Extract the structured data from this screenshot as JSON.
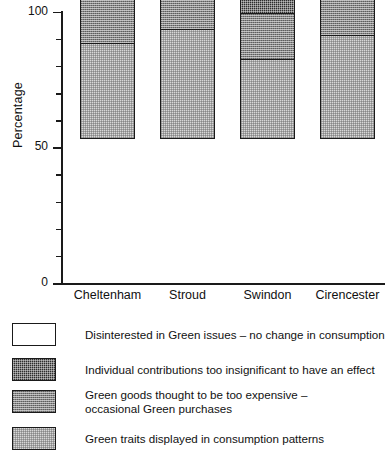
{
  "chart_data": {
    "type": "bar",
    "subtype": "stacked-bar-100",
    "title": "",
    "xlabel": "",
    "ylabel": "Percentage",
    "ylim": [
      0,
      100
    ],
    "yticks": [
      0,
      50,
      100
    ],
    "ytick_labels": [
      "0",
      "50",
      "100"
    ],
    "yminor_ticks": [
      10,
      20,
      30,
      40,
      60,
      70,
      80,
      90
    ],
    "grid": false,
    "legend_position": "below",
    "categories": [
      "Cheltenham",
      "Stroud",
      "Swindon",
      "Cirencester"
    ],
    "series": [
      {
        "name": "Green traits displayed in consumption patterns",
        "key": "green-traits",
        "fill": "light",
        "color": "#d7d7d7",
        "values": [
          35,
          40,
          29,
          38
        ]
      },
      {
        "name": "Green goods thought to be too expensive –\noccasional Green purchases",
        "key": "too-expensive",
        "fill": "mid",
        "color": "#868686",
        "values": [
          24,
          21,
          17,
          15
        ]
      },
      {
        "name": "Individual contributions too insignificant to have an effect",
        "key": "insignificant",
        "fill": "dark",
        "color": "#2e2e2e",
        "values": [
          24,
          26,
          31,
          27
        ]
      },
      {
        "name": "Disinterested in Green issues – no change in consumption",
        "key": "disinterested",
        "fill": "white",
        "color": "#ffffff",
        "values": [
          17,
          13,
          23,
          20
        ]
      }
    ],
    "cumulative_tops": {
      "Cheltenham": [
        35,
        59,
        83,
        100
      ],
      "Stroud": [
        40,
        61,
        87,
        100
      ],
      "Swindon": [
        29,
        46,
        77,
        100
      ],
      "Cirencester": [
        38,
        53,
        80,
        100
      ]
    }
  },
  "legend": {
    "items": [
      {
        "label": "Disinterested in Green issues – no change in consumption",
        "fill": "white"
      },
      {
        "label": "Individual contributions too insignificant to have an effect",
        "fill": "dark"
      },
      {
        "label": "Green goods thought to be too expensive –\noccasional Green purchases",
        "fill": "mid"
      },
      {
        "label": "Green traits displayed in consumption patterns",
        "fill": "light"
      }
    ]
  }
}
